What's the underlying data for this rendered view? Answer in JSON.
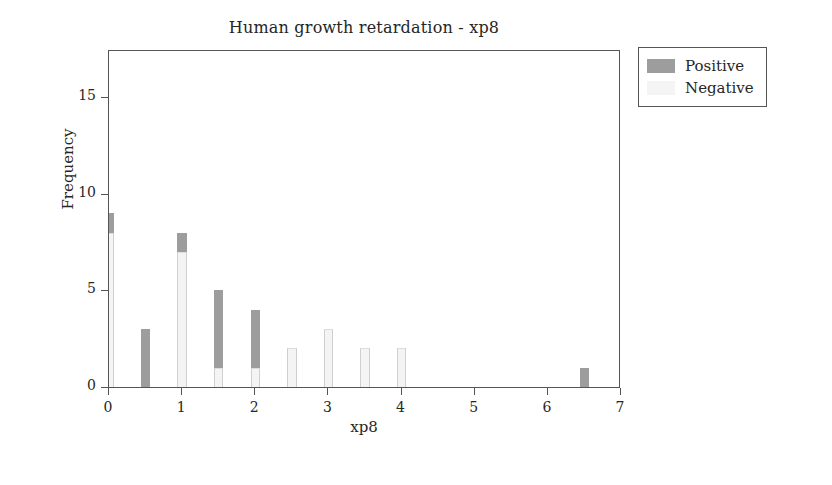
{
  "chart_data": {
    "type": "bar",
    "title": "Human growth retardation - xp8",
    "xlabel": "xp8",
    "ylabel": "Frequency",
    "xlim": [
      0,
      7
    ],
    "ylim": [
      0,
      17.5
    ],
    "xticks": [
      "0",
      "1",
      "2",
      "3",
      "4",
      "5",
      "6",
      "7"
    ],
    "xtick_values": [
      0,
      1,
      2,
      3,
      4,
      5,
      6,
      7
    ],
    "yticks": [
      "0",
      "5",
      "10",
      "15"
    ],
    "ytick_values": [
      0,
      5,
      10,
      15
    ],
    "grid": false,
    "stacked": true,
    "legend_position": "outside top-right",
    "bar_width": 0.13,
    "x": [
      0,
      0.5,
      1,
      1.5,
      2,
      2.5,
      3,
      3.5,
      4,
      6.5
    ],
    "series": [
      {
        "name": "Positive",
        "color": "#9d9d9d",
        "values": [
          1,
          3,
          1,
          4,
          3,
          0,
          0,
          0,
          0,
          1
        ]
      },
      {
        "name": "Negative",
        "color": "#f4f4f4",
        "values": [
          8,
          0,
          7,
          1,
          1,
          2,
          3,
          2,
          2,
          0
        ]
      }
    ]
  },
  "legend": {
    "items": [
      {
        "label": "Positive",
        "swatch": "positive"
      },
      {
        "label": "Negative",
        "swatch": "negative"
      }
    ]
  }
}
